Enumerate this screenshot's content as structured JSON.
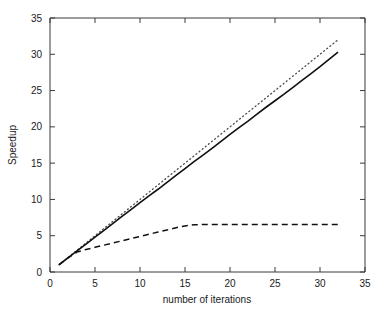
{
  "chart_data": {
    "type": "line",
    "title": "",
    "xlabel": "number of iterations",
    "ylabel": "Speedup",
    "xlim": [
      0,
      35
    ],
    "ylim": [
      0,
      35
    ],
    "xticks": [
      0,
      5,
      10,
      15,
      20,
      25,
      30,
      35
    ],
    "yticks": [
      0,
      5,
      10,
      15,
      20,
      25,
      30,
      35
    ],
    "xtick_labels": [
      "0",
      "5",
      "10",
      "15",
      "20",
      "25",
      "30",
      "35"
    ],
    "ytick_labels": [
      "0",
      "5",
      "10",
      "15",
      "20",
      "25",
      "30",
      "35"
    ],
    "grid": false,
    "legend": "none",
    "series": [
      {
        "name": "ideal-speedup",
        "style": "dotted",
        "color": "#4a4a4a",
        "x": [
          1,
          2,
          3,
          4,
          5,
          6,
          7,
          8,
          9,
          10,
          11,
          12,
          13,
          14,
          15,
          16,
          17,
          18,
          19,
          20,
          21,
          22,
          23,
          24,
          25,
          26,
          27,
          28,
          29,
          30,
          31,
          32
        ],
        "y": [
          1.0,
          2.0,
          3.0,
          4.0,
          5.0,
          6.0,
          7.0,
          8.0,
          9.0,
          10.0,
          11.0,
          12.0,
          13.0,
          14.0,
          15.0,
          16.0,
          17.0,
          18.0,
          19.0,
          20.0,
          21.0,
          22.0,
          23.0,
          24.0,
          25.0,
          26.0,
          27.0,
          28.0,
          29.0,
          30.0,
          31.0,
          32.0
        ]
      },
      {
        "name": "measured-speedup",
        "style": "solid",
        "color": "#111111",
        "x": [
          1,
          2,
          3,
          4,
          5,
          6,
          7,
          8,
          9,
          10,
          11,
          12,
          13,
          14,
          15,
          16,
          17,
          18,
          19,
          20,
          21,
          22,
          23,
          24,
          25,
          26,
          27,
          28,
          29,
          30,
          31,
          32
        ],
        "y": [
          1.0,
          1.95,
          2.9,
          3.85,
          4.8,
          5.75,
          6.7,
          7.65,
          8.6,
          9.55,
          10.5,
          11.4,
          12.35,
          13.3,
          14.25,
          15.2,
          16.1,
          17.05,
          18.0,
          18.95,
          19.9,
          20.8,
          21.75,
          22.7,
          23.6,
          24.5,
          25.45,
          26.4,
          27.35,
          28.3,
          29.3,
          30.3
        ]
      },
      {
        "name": "saturating-speedup",
        "style": "dashed",
        "color": "#111111",
        "x": [
          1,
          2,
          3,
          4,
          5,
          6,
          7,
          8,
          9,
          10,
          11,
          12,
          13,
          14,
          15,
          16,
          17,
          18,
          19,
          20,
          21,
          22,
          23,
          24,
          25,
          26,
          27,
          28,
          29,
          30,
          31,
          32
        ],
        "y": [
          1.0,
          1.95,
          2.75,
          3.1,
          3.4,
          3.7,
          4.0,
          4.3,
          4.6,
          4.9,
          5.2,
          5.5,
          5.8,
          6.1,
          6.35,
          6.5,
          6.55,
          6.55,
          6.55,
          6.55,
          6.55,
          6.55,
          6.55,
          6.55,
          6.55,
          6.55,
          6.55,
          6.55,
          6.55,
          6.55,
          6.55,
          6.55
        ]
      }
    ]
  }
}
